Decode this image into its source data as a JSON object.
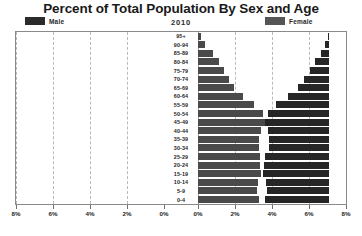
{
  "header": {
    "title": "Percent of Total Population By Sex and Age",
    "year": "2010"
  },
  "legend": {
    "male": {
      "label": "Male",
      "color": "#262626",
      "icon": "legend-swatch"
    },
    "female": {
      "label": "Female",
      "color": "#4a4a4a",
      "icon": "legend-swatch"
    }
  },
  "axis": {
    "x_tick_labels": [
      "8%",
      "6%",
      "4%",
      "2%",
      "0%",
      "0%",
      "2%",
      "4%",
      "6%",
      "8%"
    ],
    "x_tick_values": [
      -8,
      -6,
      -4,
      -2,
      0,
      0,
      2,
      4,
      6,
      8
    ],
    "x_max": 8,
    "grid": "dashed-vertical"
  },
  "chart_data": {
    "type": "bar",
    "title": "Percent of Total Population By Sex and Age",
    "subtitle": "2010",
    "xlabel": "",
    "ylabel": "",
    "orientation": "horizontal-pyramid",
    "xlim": [
      -8,
      8
    ],
    "grid": true,
    "legend_position": "top",
    "categories": [
      "95+",
      "90-94",
      "85-89",
      "80-84",
      "75-79",
      "70-74",
      "65-69",
      "60-64",
      "55-59",
      "50-54",
      "45-49",
      "40-44",
      "35-39",
      "30-34",
      "25-29",
      "20-24",
      "15-19",
      "10-14",
      "5-9",
      "0-4"
    ],
    "series": [
      {
        "name": "Male",
        "color": "#262626",
        "values": [
          0.05,
          0.2,
          0.45,
          0.75,
          1.05,
          1.35,
          1.7,
          2.2,
          2.85,
          3.3,
          3.45,
          3.3,
          3.25,
          3.25,
          3.45,
          3.5,
          3.55,
          3.4,
          3.35,
          3.45
        ]
      },
      {
        "name": "Female",
        "color": "#4a4a4a",
        "values": [
          0.15,
          0.4,
          0.8,
          1.15,
          1.4,
          1.65,
          1.95,
          2.45,
          3.05,
          3.5,
          3.6,
          3.4,
          3.3,
          3.3,
          3.35,
          3.35,
          3.4,
          3.25,
          3.2,
          3.3
        ]
      }
    ]
  }
}
